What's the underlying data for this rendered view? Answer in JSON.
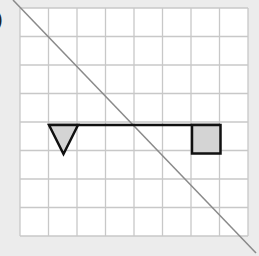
{
  "label": ")",
  "colors": {
    "background": "#ececec",
    "grid_bg": "#ffffff",
    "grid_line": "#c8c8c8",
    "diagonal": "#8a8a8a",
    "shape_stroke": "#111111",
    "shape_fill": "#d4d4d4"
  },
  "grid": {
    "columns": 8,
    "rows": 8,
    "left": 20,
    "top": 8,
    "cell": 28.5
  },
  "diagonal": {
    "x1": 13,
    "y1": 0,
    "x2": 256,
    "y2": 253
  },
  "shapes": {
    "line": {
      "x1": 49,
      "y1": 125,
      "x2": 220,
      "y2": 125
    },
    "triangle": {
      "points": "49,125 78,125 63.5,154"
    },
    "square": {
      "x": 192,
      "y": 125,
      "w": 28.5,
      "h": 28.5
    }
  }
}
